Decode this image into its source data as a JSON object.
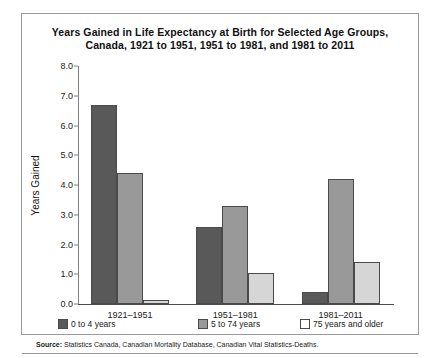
{
  "chart_data": {
    "type": "bar",
    "title": "Years Gained in Life Expectancy at Birth for Selected Age Groups, Canada, 1921 to 1951, 1951 to 1981, and 1981 to 2011",
    "title_line1": "Years Gained in Life Expectancy at Birth for Selected Age Groups,",
    "title_line2": "Canada, 1921 to 1951, 1951 to 1981, and 1981 to 2011",
    "xlabel": "",
    "ylabel": "Years Gained",
    "ylim": [
      0.0,
      8.0
    ],
    "ytick_labels": [
      "8.0",
      "7.0",
      "6.0",
      "5.0",
      "4.0",
      "3.0",
      "2.0",
      "1.0",
      "0.0"
    ],
    "ytick_values": [
      8.0,
      7.0,
      6.0,
      5.0,
      4.0,
      3.0,
      2.0,
      1.0,
      0.0
    ],
    "grid": false,
    "legend_position": "bottom",
    "categories": [
      "1921–1951",
      "1951–1981",
      "1981–2011"
    ],
    "series": [
      {
        "name": "0 to 4 years",
        "color": "#595959",
        "values": [
          6.7,
          2.6,
          0.4
        ]
      },
      {
        "name": "5 to 74 years",
        "color": "#999999",
        "values": [
          4.4,
          3.3,
          4.2
        ]
      },
      {
        "name": "75 years and older",
        "color": "#d6d6d6",
        "values": [
          0.15,
          1.05,
          1.4
        ]
      }
    ]
  },
  "source": {
    "label": "Source:",
    "text": " Statistics Canada, Canadian Mortality Database, Canadian Vital Statistics-Deaths."
  }
}
